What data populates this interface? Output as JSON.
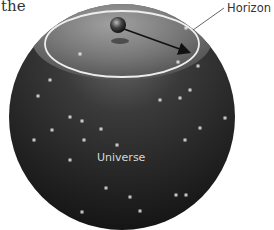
{
  "text_fragment": "the",
  "labels": {
    "horizon": "Horizon",
    "universe": "Universe"
  },
  "colors": {
    "sphere_dark": "#1c1c1c",
    "sphere_mid": "#4a4a4a",
    "horizon_cap": "#7a7a7a",
    "horizon_ring": "#e8e8e8",
    "star": "#ffffff"
  },
  "sphere": {
    "cx": 122,
    "cy": 117,
    "r": 113
  },
  "horizon_ellipse": {
    "cx": 122,
    "cy": 44,
    "rx": 77,
    "ry": 33
  },
  "observer": {
    "cx": 118,
    "cy": 25,
    "r": 8
  },
  "arrow": {
    "x1": 124,
    "y1": 29,
    "x2": 190,
    "y2": 53
  },
  "stars": [
    [
      80,
      54
    ],
    [
      186,
      28
    ],
    [
      178,
      62
    ],
    [
      50,
      80
    ],
    [
      38,
      96
    ],
    [
      52,
      130
    ],
    [
      70,
      117
    ],
    [
      101,
      129
    ],
    [
      82,
      121
    ],
    [
      198,
      66
    ],
    [
      190,
      90
    ],
    [
      180,
      98
    ],
    [
      160,
      100
    ],
    [
      200,
      128
    ],
    [
      185,
      140
    ],
    [
      117,
      145
    ],
    [
      84,
      140
    ],
    [
      34,
      140
    ],
    [
      106,
      188
    ],
    [
      82,
      212
    ],
    [
      130,
      197
    ],
    [
      140,
      211
    ],
    [
      176,
      195
    ],
    [
      186,
      195
    ],
    [
      168,
      219
    ],
    [
      107,
      232
    ],
    [
      225,
      118
    ],
    [
      22,
      188
    ],
    [
      70,
      160
    ]
  ]
}
